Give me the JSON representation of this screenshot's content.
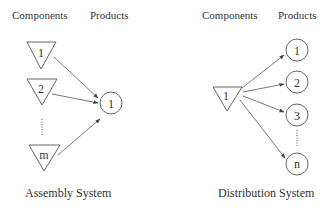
{
  "assembly": {
    "header_components": "Components",
    "header_products": "Products",
    "components": [
      {
        "label": "1"
      },
      {
        "label": "2"
      },
      {
        "label": "m"
      }
    ],
    "products": [
      {
        "label": "1"
      }
    ],
    "caption": "Assembly System"
  },
  "distribution": {
    "header_components": "Components",
    "header_products": "Products",
    "components": [
      {
        "label": "1"
      }
    ],
    "products": [
      {
        "label": "1"
      },
      {
        "label": "2"
      },
      {
        "label": "3"
      },
      {
        "label": "n"
      }
    ],
    "caption": "Distribution System"
  },
  "colors": {
    "stroke": "#555555",
    "text": "#333333",
    "background": "#ffffff"
  }
}
